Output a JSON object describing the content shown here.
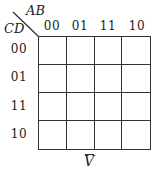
{
  "kmap": {
    "row_var": "CD",
    "col_var": "AB",
    "col_codes": [
      "00",
      "01",
      "11",
      "10"
    ],
    "row_codes": [
      "00",
      "01",
      "11",
      "10"
    ],
    "cells": [
      [
        "",
        "",
        "",
        ""
      ],
      [
        "",
        "",
        "",
        ""
      ],
      [
        "",
        "",
        "",
        ""
      ],
      [
        "",
        "",
        "",
        ""
      ]
    ],
    "function_label": "V",
    "function_overline": true
  },
  "colors": {
    "line": "#333333",
    "background": "#ffffff"
  }
}
